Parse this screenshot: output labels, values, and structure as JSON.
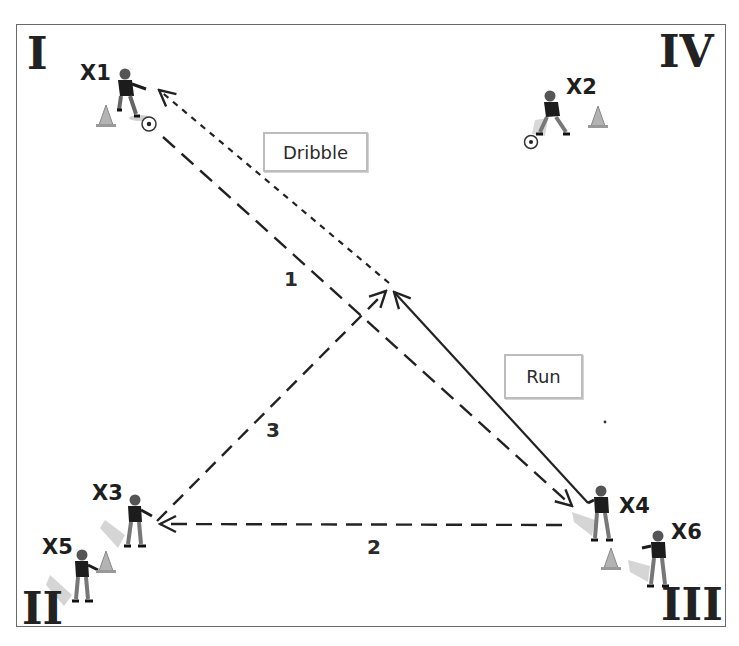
{
  "diagram": {
    "type": "soccer-drill",
    "colors": {
      "line": "#222222",
      "frame": "#6a6a6a",
      "box_border": "#bdbdbd",
      "figure": "#1e1e1e",
      "cone": "#9a9a9a"
    }
  },
  "corners": [
    {
      "id": "I",
      "label": "I"
    },
    {
      "id": "II",
      "label": "II"
    },
    {
      "id": "III",
      "label": "III"
    },
    {
      "id": "IV",
      "label": "IV"
    }
  ],
  "players": [
    {
      "id": "X1",
      "label": "X1",
      "has_ball": true,
      "has_cone": true
    },
    {
      "id": "X2",
      "label": "X2",
      "has_ball": true,
      "has_cone": true
    },
    {
      "id": "X3",
      "label": "X3",
      "has_ball": false,
      "has_cone": false
    },
    {
      "id": "X4",
      "label": "X4",
      "has_ball": false,
      "has_cone": false
    },
    {
      "id": "X5",
      "label": "X5",
      "has_ball": false,
      "has_cone": true
    },
    {
      "id": "X6",
      "label": "X6",
      "has_ball": false,
      "has_cone": true
    }
  ],
  "actions": {
    "dribble": {
      "label": "Dribble",
      "style": "dotted"
    },
    "run": {
      "label": "Run",
      "style": "solid"
    }
  },
  "passes": [
    {
      "number": "1",
      "from": "X1",
      "to": "X4",
      "style": "dashed"
    },
    {
      "number": "2",
      "from": "X4",
      "to": "X3",
      "style": "dashed"
    },
    {
      "number": "3",
      "from": "X3",
      "to": "center",
      "style": "dashed"
    }
  ]
}
